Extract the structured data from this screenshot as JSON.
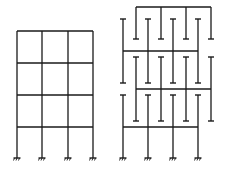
{
  "diagram": {
    "stroke_color": "#1a1a1a",
    "background": "#ffffff",
    "left_frame": {
      "columns_x": [
        17,
        42,
        68,
        93
      ],
      "beams_y": [
        31,
        63,
        95,
        127
      ],
      "top_y": 31,
      "base_y": 158,
      "bays": 3,
      "stories": 4,
      "support": "fixed"
    },
    "right_frame": {
      "groups": [
        {
          "name": "top-b",
          "columns_x": [
            136,
            161,
            186,
            211
          ],
          "beam_y": 7,
          "col_top": 7,
          "col_bottom": 39,
          "top_caps": false,
          "bottom_caps": true
        },
        {
          "name": "a1",
          "columns_x": [
            123,
            148,
            173,
            198
          ],
          "beam_y": 51,
          "col_top": 19,
          "col_bottom": 83,
          "top_caps": true,
          "bottom_caps": true
        },
        {
          "name": "b1",
          "columns_x": [
            136,
            161,
            186,
            211
          ],
          "beam_y": 89,
          "col_top": 57,
          "col_bottom": 121,
          "top_caps": true,
          "bottom_caps": true
        },
        {
          "name": "a2-base",
          "columns_x": [
            123,
            148,
            173,
            198
          ],
          "beam_y": 127,
          "col_top": 95,
          "col_bottom": 158,
          "top_caps": true,
          "bottom_caps": false,
          "support": "fixed"
        }
      ]
    }
  }
}
